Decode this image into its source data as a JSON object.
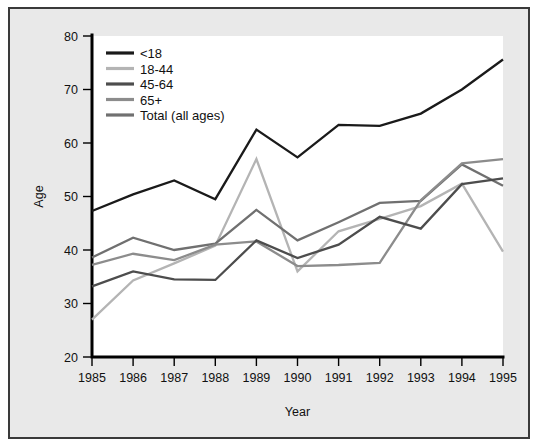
{
  "chart_data": {
    "type": "line",
    "title": "",
    "xlabel": "Year",
    "ylabel": "Age",
    "x": [
      1985,
      1986,
      1987,
      1988,
      1989,
      1990,
      1991,
      1992,
      1993,
      1994,
      1995
    ],
    "xticklabels": [
      "1985",
      "1986",
      "1987",
      "1988",
      "1989",
      "1990",
      "1991",
      "1992",
      "1993",
      "1994",
      "1995"
    ],
    "yticklabels": [
      "20",
      "30",
      "40",
      "50",
      "60",
      "70",
      "80"
    ],
    "xlim": [
      1985,
      1995
    ],
    "ylim": [
      20,
      80
    ],
    "ytick_step": 10,
    "grid": false,
    "legend_position": "top-left",
    "series": [
      {
        "name": "<18",
        "color": "#1a1a1a",
        "values": [
          47.3,
          50.4,
          53.0,
          49.5,
          62.5,
          57.3,
          63.4,
          63.2,
          65.5,
          70.0,
          75.6
        ]
      },
      {
        "name": "18-44",
        "color": "#b4b4b4",
        "values": [
          27.0,
          34.3,
          37.5,
          40.8,
          57.0,
          36.0,
          43.5,
          45.8,
          48.2,
          52.4,
          39.7
        ]
      },
      {
        "name": "45-64",
        "color": "#4d4d4d",
        "values": [
          33.2,
          36.0,
          34.5,
          34.4,
          41.8,
          38.5,
          41.0,
          46.2,
          44.0,
          52.3,
          53.4
        ]
      },
      {
        "name": "65+",
        "color": "#8c8c8c",
        "values": [
          37.2,
          39.3,
          38.1,
          41.0,
          41.6,
          37.0,
          37.2,
          37.6,
          49.3,
          56.2,
          57.0
        ]
      },
      {
        "name": "Total (all ages)",
        "color": "#707070",
        "values": [
          38.6,
          42.3,
          40.0,
          41.2,
          47.5,
          41.8,
          45.2,
          48.8,
          49.2,
          56.0,
          52.0
        ]
      }
    ]
  },
  "legend": {
    "items": [
      {
        "label": "<18"
      },
      {
        "label": "18-44"
      },
      {
        "label": "45-64"
      },
      {
        "label": "65+"
      },
      {
        "label": "Total (all ages)"
      }
    ]
  },
  "colors": {
    "panel_background": "#e9e9e9",
    "plot_background": "#ffffff",
    "panel_border": "#3a3a3a",
    "axis": "#000000",
    "text": "#111111"
  }
}
